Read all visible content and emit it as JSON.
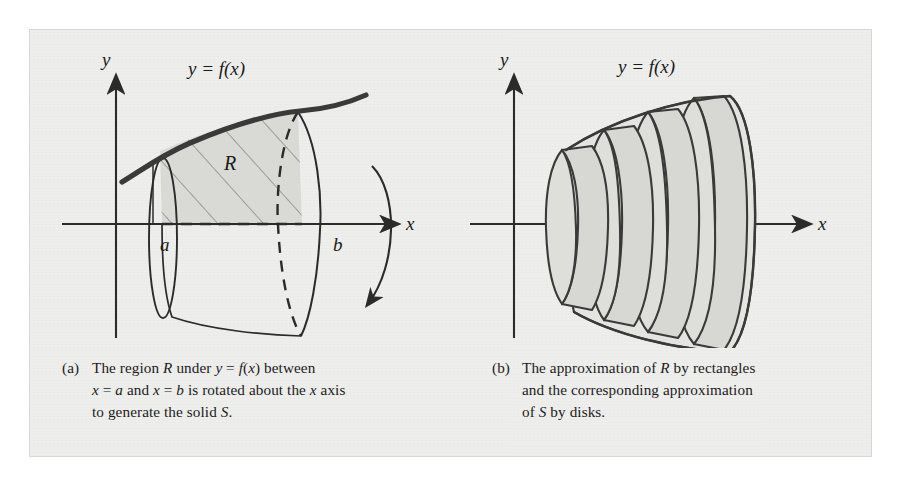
{
  "figure": {
    "panel_background": "#eeeeec",
    "page_background": "#ffffff",
    "ink_color": "#2b2b2b",
    "shade_color": "#d9d9d6"
  },
  "panels": [
    {
      "id": "a",
      "marker": "(a)",
      "axis_x_label": "x",
      "axis_y_label": "y",
      "curve_label": "y = f(x)",
      "region_label": "R",
      "bound_left_label": "a",
      "bound_right_label": "b",
      "rotation_arrow": "rotation-arrow",
      "caption_lines": [
        "The region R under y = f(x) between",
        "x = a and x = b is rotated about the x axis",
        "to generate the solid S."
      ]
    },
    {
      "id": "b",
      "marker": "(b)",
      "axis_x_label": "x",
      "axis_y_label": "y",
      "curve_label": "y = f(x)",
      "disk_count": 4,
      "caption_lines": [
        "The approximation of R by rectangles",
        "and the corresponding approximation",
        "of S by disks."
      ]
    }
  ]
}
